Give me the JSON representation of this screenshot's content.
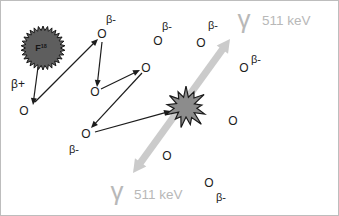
{
  "figure": {
    "description_domain": "diagram",
    "labels": {
      "nucleus_symbol": "F",
      "nucleus_mass_number": "18",
      "positron": "β+",
      "electron_symbol": "O",
      "beta_minus": "β-",
      "gamma_symbol": "γ",
      "gamma_energy": "511 keV"
    },
    "colors": {
      "ink": "#1c1c1c",
      "nucleus_fill": "#5e5e5e",
      "nucleus_stroke": "#151515",
      "star_fill": "#8c8c8c",
      "star_stroke": "#1a1a1a",
      "gamma_band": "#cbcbcb",
      "gamma_text": "#b8b8b8",
      "background": "#ffffff",
      "border": "#bdbdbd"
    },
    "nucleus": {
      "x": 42,
      "y": 47,
      "outer_r": 22,
      "inner_r": 17.5,
      "teeth": 30
    },
    "positron_label_pos": {
      "x": 17,
      "y": 83
    },
    "annihilation_star": {
      "x": 185,
      "y": 106
    },
    "scatter_path_arrows": [
      {
        "x1": 37,
        "y1": 66,
        "x2": 32,
        "y2": 104
      },
      {
        "x1": 34,
        "y1": 101,
        "x2": 97,
        "y2": 38
      },
      {
        "x1": 101,
        "y1": 41,
        "x2": 96,
        "y2": 86
      },
      {
        "x1": 100,
        "y1": 88,
        "x2": 139,
        "y2": 69
      },
      {
        "x1": 141,
        "y1": 72,
        "x2": 90,
        "y2": 127
      },
      {
        "x1": 94,
        "y1": 131,
        "x2": 170,
        "y2": 110
      }
    ],
    "electrons": [
      {
        "x": 23,
        "y": 110
      },
      {
        "x": 101,
        "y": 33,
        "beta": {
          "x": 110,
          "y": 18
        }
      },
      {
        "x": 94,
        "y": 91
      },
      {
        "x": 145,
        "y": 67
      },
      {
        "x": 85,
        "y": 133,
        "beta": {
          "x": 73,
          "y": 148
        }
      },
      {
        "x": 157,
        "y": 40,
        "beta": {
          "x": 166,
          "y": 25
        }
      },
      {
        "x": 200,
        "y": 42,
        "beta": {
          "x": 212,
          "y": 24
        }
      },
      {
        "x": 243,
        "y": 67,
        "beta": {
          "x": 255,
          "y": 58
        }
      },
      {
        "x": 232,
        "y": 120
      },
      {
        "x": 166,
        "y": 155
      },
      {
        "x": 208,
        "y": 182,
        "beta": {
          "x": 220,
          "y": 196
        }
      }
    ],
    "gamma_band": {
      "x1": 132,
      "y1": 172,
      "x2": 229,
      "y2": 38,
      "width": 7
    },
    "gamma_labels": [
      {
        "glyph": {
          "x": 243,
          "y": 27
        },
        "energy": {
          "x": 261,
          "y": 24
        }
      },
      {
        "glyph": {
          "x": 116,
          "y": 199
        },
        "energy": {
          "x": 133,
          "y": 198
        }
      }
    ]
  }
}
